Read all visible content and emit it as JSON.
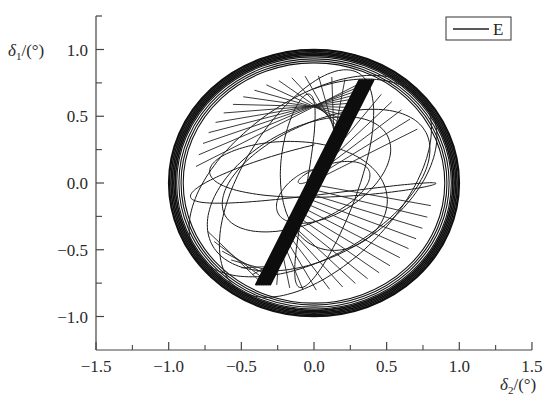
{
  "chart_data": {
    "type": "line",
    "title": "",
    "xlabel": "δ2/(°)",
    "ylabel": "δ1/(°)",
    "xlim": [
      -1.5,
      1.5
    ],
    "ylim": [
      -1.2,
      1.25
    ],
    "x_ticks": [
      -1.5,
      -1.0,
      -0.5,
      0.0,
      0.5,
      1.0,
      1.5
    ],
    "x_tick_labels": [
      "−1.5",
      "−1.0",
      "−0.5",
      "0.0",
      "0.5",
      "1.0",
      "1.5"
    ],
    "x_minor_ticks": [
      -1.25,
      -0.75,
      -0.25,
      0.25,
      0.75,
      1.25
    ],
    "y_ticks": [
      -1.0,
      -0.5,
      0.0,
      0.5,
      1.0
    ],
    "y_tick_labels": [
      "−1.0",
      "−0.5",
      "0.0",
      "0.5",
      "1.0"
    ],
    "y_minor_ticks": [
      -0.75,
      -0.25,
      0.25,
      0.75
    ],
    "grid": false,
    "legend": {
      "position": "upper right",
      "entries": [
        "E"
      ]
    },
    "series": [
      {
        "name": "E",
        "color": "#111111",
        "description": "Phase trajectory of δ1 vs δ2: dense quasi-periodic orbit bounded by a near-unit circle (outer ring radius ≈0.93–1.0) with a dense diagonal band from (−0.35,−0.76) to (0.36,0.77) and interior crossing loops",
        "outer_envelope": {
          "center": [
            0.0,
            0.0
          ],
          "radius_x": 1.0,
          "radius_y": 1.0
        },
        "inner_ring_radii": [
          0.93,
          0.95,
          0.97,
          0.99,
          1.0
        ],
        "diagonal_band": {
          "start": [
            -0.35,
            -0.76
          ],
          "end": [
            0.36,
            0.77
          ]
        }
      }
    ]
  },
  "axes": {
    "x_title_symbol": "δ",
    "x_title_sub": "2",
    "x_title_unit": "/(°)",
    "y_title_symbol": "δ",
    "y_title_sub": "1",
    "y_title_unit": "/(°)"
  },
  "legend": {
    "label": "E"
  }
}
